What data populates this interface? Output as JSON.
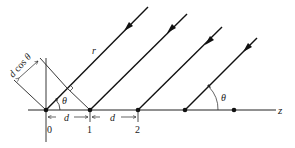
{
  "diagram": {
    "type": "antenna-array-geometry",
    "axis_label": "z",
    "ray_label": "r",
    "angle_label": "θ",
    "path_difference_label": "d cos θ",
    "spacing_label": "d",
    "element_labels": [
      "0",
      "1",
      "2"
    ],
    "num_elements": 5,
    "num_rays": 4,
    "colors": {
      "line": "#111111",
      "background": "#ffffff"
    }
  }
}
